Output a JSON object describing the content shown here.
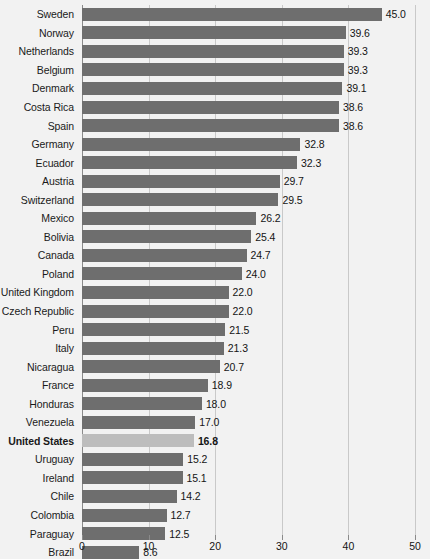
{
  "chart_data": {
    "type": "bar",
    "orientation": "horizontal",
    "title": "",
    "xlabel": "",
    "ylabel": "",
    "xlim": [
      0,
      50
    ],
    "xticks": [
      "0",
      "10",
      "20",
      "30",
      "40",
      "50"
    ],
    "grid": true,
    "legend": "none",
    "highlight_category": "United States",
    "colors": {
      "bar": "#6e6e6e",
      "bar_highlight": "#bdbdbd",
      "background": "#f2f2f2",
      "gridline": "#c9c9c9",
      "axis": "#8a8a8a",
      "text": "#141414"
    },
    "categories": [
      "Sweden",
      "Norway",
      "Netherlands",
      "Belgium",
      "Denmark",
      "Costa Rica",
      "Spain",
      "Germany",
      "Ecuador",
      "Austria",
      "Switzerland",
      "Mexico",
      "Bolivia",
      "Canada",
      "Poland",
      "United Kingdom",
      "Czech Republic",
      "Peru",
      "Italy",
      "Nicaragua",
      "France",
      "Honduras",
      "Venezuela",
      "United States",
      "Uruguay",
      "Ireland",
      "Chile",
      "Colombia",
      "Paraguay",
      "Brazil"
    ],
    "values": [
      45.0,
      39.6,
      39.3,
      39.3,
      39.1,
      38.6,
      38.6,
      32.8,
      32.3,
      29.7,
      29.5,
      26.2,
      25.4,
      24.7,
      24.0,
      22.0,
      22.0,
      21.5,
      21.3,
      20.7,
      18.9,
      18.0,
      17.0,
      16.8,
      15.2,
      15.1,
      14.2,
      12.7,
      12.5,
      8.6
    ],
    "value_labels": [
      "45.0",
      "39.6",
      "39.3",
      "39.3",
      "39.1",
      "38.6",
      "38.6",
      "32.8",
      "32.3",
      "29.7",
      "29.5",
      "26.2",
      "25.4",
      "24.7",
      "24.0",
      "22.0",
      "22.0",
      "21.5",
      "21.3",
      "20.7",
      "18.9",
      "18.0",
      "17.0",
      "16.8",
      "15.2",
      "15.1",
      "14.2",
      "12.7",
      "12.5",
      "8.6"
    ]
  }
}
